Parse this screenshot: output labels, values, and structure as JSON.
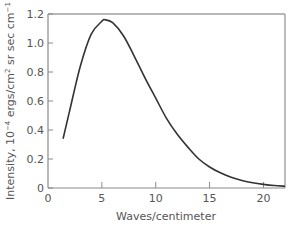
{
  "chart_data": {
    "type": "line",
    "title": "",
    "xlabel": "Waves/centimeter",
    "ylabel": "Intensity, 10^-4 ergs/cm^2 sr sec cm^-1",
    "ylabel_parts": {
      "pre": "Intensity, 10",
      "exp1": "−4",
      "mid": " ergs/cm",
      "exp2": "2",
      "post": " sr sec cm",
      "exp3": "−1"
    },
    "xlim": [
      0,
      22
    ],
    "ylim": [
      0,
      1.2
    ],
    "xticks": [
      "0",
      "5",
      "10",
      "15",
      "20"
    ],
    "xtick_values": [
      0,
      5,
      10,
      15,
      20
    ],
    "yticks": [
      "0",
      "0.2",
      "0.4",
      "0.6",
      "0.8",
      "1.0",
      "1.2"
    ],
    "ytick_values": [
      0,
      0.2,
      0.4,
      0.6,
      0.8,
      1.0,
      1.2
    ],
    "grid": false,
    "legend": null,
    "series": [
      {
        "name": "Intensity",
        "color": "#333333",
        "x": [
          1.4,
          2,
          3,
          4,
          5,
          5.3,
          6,
          7,
          8,
          9,
          10,
          11,
          12,
          13,
          14,
          15,
          16,
          17,
          18,
          19,
          20,
          21,
          22
        ],
        "y": [
          0.34,
          0.53,
          0.84,
          1.06,
          1.15,
          1.16,
          1.14,
          1.05,
          0.91,
          0.76,
          0.62,
          0.48,
          0.37,
          0.28,
          0.2,
          0.145,
          0.105,
          0.074,
          0.052,
          0.036,
          0.025,
          0.017,
          0.012
        ]
      }
    ]
  },
  "colors": {
    "axis": "#8a8a8a",
    "frame": "#a0a0a0",
    "line": "#333333",
    "text": "#555555"
  }
}
